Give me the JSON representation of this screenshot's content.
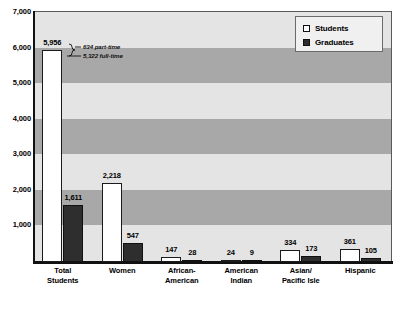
{
  "chart_data": {
    "type": "bar",
    "title": "",
    "xlabel": "",
    "ylabel": "",
    "ylim": [
      0,
      7000
    ],
    "grid": true,
    "legend_position": "top-right",
    "categories": [
      "Total Students",
      "Women",
      "African-American",
      "American Indian",
      "Asian/Pacific Isle",
      "Hispanic"
    ],
    "category_lines": [
      [
        "Total",
        "Students"
      ],
      [
        "Women",
        ""
      ],
      [
        "African-",
        "American"
      ],
      [
        "American",
        "Indian"
      ],
      [
        "Asian/",
        "Pacific Isle"
      ],
      [
        "Hispanic",
        ""
      ]
    ],
    "series": [
      {
        "name": "Students",
        "color": "#ffffff",
        "values": [
          5956,
          2218,
          147,
          24,
          334,
          361
        ],
        "labels": [
          "5,956",
          "2,218",
          "147",
          "24",
          "334",
          "361"
        ]
      },
      {
        "name": "Graduates",
        "color": "#2e2e2e",
        "values": [
          1611,
          547,
          28,
          9,
          173,
          105
        ],
        "labels": [
          "1,611",
          "547",
          "28",
          "9",
          "173",
          "105"
        ]
      }
    ],
    "yticks": [
      1000,
      2000,
      3000,
      4000,
      5000,
      6000,
      7000
    ],
    "ytick_labels": [
      "1,000",
      "2,000",
      "3,000",
      "4,000",
      "5,000",
      "6,000",
      "7,000"
    ],
    "annotations": [
      {
        "text": "634 part-time",
        "value": 634
      },
      {
        "text": "5,322 full-time",
        "value": 5322
      }
    ]
  },
  "legend": {
    "items": [
      {
        "label": "Students",
        "swatch": "white-square-icon"
      },
      {
        "label": "Graduates",
        "swatch": "dark-square-icon"
      }
    ]
  }
}
